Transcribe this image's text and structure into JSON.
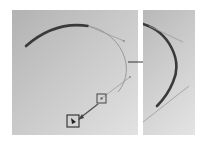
{
  "diagram": {
    "title": "",
    "panels": [
      {
        "id": "before",
        "description": "Bezier curve with handles; handle point being dragged"
      },
      {
        "id": "after",
        "description": "Resulting reshaped curve"
      }
    ],
    "colors": {
      "curve_thick": "#3a3a3a",
      "curve_thin": "#8a8a8a",
      "handle_line": "#9a9a9a",
      "arrow": "#333333",
      "handle_box": "#444444",
      "panel_dark": "#b2b2b2",
      "panel_light": "#e2e2e2"
    },
    "arrow_label": "",
    "icons": {
      "anchor_handle": "square-handle-icon",
      "cursor": "pointer-cursor-icon",
      "transition_arrow": "right-arrow-icon"
    }
  }
}
